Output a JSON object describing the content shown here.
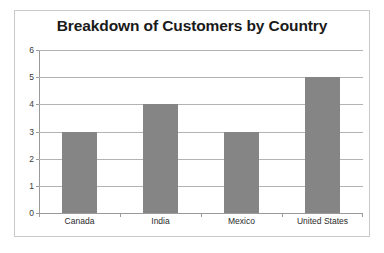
{
  "chart_data": {
    "type": "bar",
    "title": "Breakdown of Customers by Country",
    "categories": [
      "Canada",
      "India",
      "Mexico",
      "United States"
    ],
    "values": [
      3,
      4,
      3,
      5
    ],
    "series": [
      {
        "name": "Customers",
        "values": [
          3,
          4,
          3,
          5
        ]
      }
    ],
    "xlabel": "",
    "ylabel": "",
    "ylim": [
      0,
      6
    ],
    "yticks": [
      0,
      1,
      2,
      3,
      4,
      5,
      6
    ],
    "ytick_labels": [
      "0",
      "1",
      "2",
      "3",
      "4",
      "5",
      "6"
    ],
    "grid": true,
    "grid_axis": "y",
    "legend": false,
    "legend_position": "none",
    "bar_color": "#858585",
    "gridline_color": "#b3b3b3",
    "axis_color": "#9a9a9a",
    "border_color": "#c9c9c9",
    "background_color": "#ffffff",
    "title_color": "#1a1a1a"
  }
}
